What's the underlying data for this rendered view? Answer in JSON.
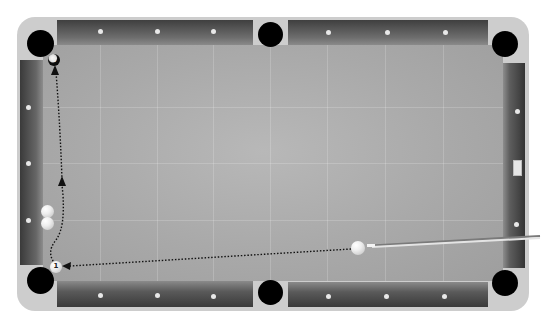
{
  "game": {
    "type": "pool-billiards",
    "view": "top-down shot planner"
  },
  "colors": {
    "frame": "#cdcdcd",
    "felt": "#a9a9a9",
    "rail_dark": "#3a3a3a",
    "pocket": "#000000",
    "diamond": "#e8e8e8",
    "path": "#111111"
  },
  "pockets": [
    {
      "id": "top-left",
      "x": 40,
      "y": 43
    },
    {
      "id": "top-center",
      "x": 270,
      "y": 35
    },
    {
      "id": "top-right",
      "x": 505,
      "y": 44
    },
    {
      "id": "bottom-left",
      "x": 40,
      "y": 280
    },
    {
      "id": "bottom-center",
      "x": 270,
      "y": 292
    },
    {
      "id": "bottom-right",
      "x": 505,
      "y": 283
    }
  ],
  "balls": {
    "target_ball": {
      "label": "8",
      "x": 54,
      "y": 60
    },
    "object_ball": {
      "label": "1",
      "x": 56,
      "y": 267
    },
    "blocker_balls": [
      {
        "x": 47,
        "y": 211
      },
      {
        "x": 47,
        "y": 223
      }
    ],
    "cue_ball": {
      "x": 358,
      "y": 248
    }
  },
  "cue_stick": {
    "tip_x": 368,
    "tip_y": 245,
    "butt_x": 540,
    "butt_y": 235
  },
  "shot_path": {
    "segments": [
      "cue-ball to object-ball",
      "object-ball up left rail",
      "to target pocket"
    ],
    "arrows": 3
  }
}
